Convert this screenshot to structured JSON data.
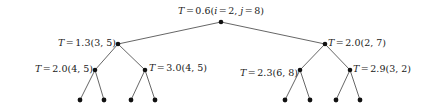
{
  "figure": {
    "type": "binary-tree-diagram",
    "width": 442,
    "height": 109,
    "background_color": "#ffffff",
    "node_color": "#111111",
    "edge_color": "#555555"
  },
  "tree": {
    "levels": 4,
    "nodes": [
      {
        "id": "root",
        "label_full": "T = 0.6(i = 2, j = 8)",
        "T_prefix": "T",
        "eq": "=",
        "T_value": "0.6",
        "open_paren": "(",
        "param1_name": "i",
        "param1_eq": "=",
        "param1_value": "2",
        "comma": ",",
        "param2_name": "j",
        "param2_eq": "=",
        "param2_value": "8",
        "close_paren": ")",
        "x": 221,
        "y": 22,
        "label_x": 221,
        "label_y": 11,
        "label_anchor": "center"
      },
      {
        "id": "n-left",
        "label_full": "T = 1.3(3, 5)",
        "T_prefix": "T",
        "eq": "=",
        "T_value": "1.3",
        "open_paren": "(",
        "param1_value": "3",
        "comma": ",",
        "param2_value": "5",
        "close_paren": ")",
        "x": 118,
        "y": 44,
        "label_x": 116,
        "label_y": 43,
        "label_anchor": "right"
      },
      {
        "id": "n-right",
        "label_full": "T = 2.0(2, 7)",
        "T_prefix": "T",
        "eq": "=",
        "T_value": "2.0",
        "open_paren": "(",
        "param1_value": "2",
        "comma": ",",
        "param2_value": "7",
        "close_paren": ")",
        "x": 325,
        "y": 44,
        "label_x": 328,
        "label_y": 43,
        "label_anchor": "left"
      },
      {
        "id": "n-left-left",
        "label_full": "T = 2.0(4, 5)",
        "T_prefix": "T",
        "eq": "=",
        "T_value": "2.0",
        "open_paren": "(",
        "param1_value": "4",
        "comma": ",",
        "param2_value": "5",
        "close_paren": ")",
        "x": 95,
        "y": 70,
        "label_x": 93,
        "label_y": 69,
        "label_anchor": "right"
      },
      {
        "id": "n-left-right",
        "label_full": "T = 3.0(4, 5)",
        "T_prefix": "T",
        "eq": "=",
        "T_value": "3.0",
        "open_paren": "(",
        "param1_value": "4",
        "comma": ",",
        "param2_value": "5",
        "close_paren": ")",
        "x": 145,
        "y": 70,
        "label_x": 149,
        "label_y": 68,
        "label_anchor": "left"
      },
      {
        "id": "n-right-left",
        "label_full": "T = 2.3(6, 8)",
        "T_prefix": "T",
        "eq": "=",
        "T_value": "2.3",
        "open_paren": "(",
        "param1_value": "6",
        "comma": ",",
        "param2_value": "8",
        "close_paren": ")",
        "x": 300,
        "y": 70,
        "label_x": 298,
        "label_y": 73,
        "label_anchor": "right"
      },
      {
        "id": "n-right-right",
        "label_full": "T = 2.9(3, 2)",
        "T_prefix": "T",
        "eq": "=",
        "T_value": "2.9",
        "open_paren": "(",
        "param1_value": "3",
        "comma": ",",
        "param2_value": "2",
        "close_paren": ")",
        "x": 350,
        "y": 70,
        "label_x": 353,
        "label_y": 69,
        "label_anchor": "left"
      }
    ],
    "leaves": [
      {
        "id": "leaf-1",
        "x": 80,
        "y": 100,
        "parent": "n-left-left"
      },
      {
        "id": "leaf-2",
        "x": 104,
        "y": 100,
        "parent": "n-left-left"
      },
      {
        "id": "leaf-3",
        "x": 131,
        "y": 100,
        "parent": "n-left-right"
      },
      {
        "id": "leaf-4",
        "x": 155,
        "y": 100,
        "parent": "n-left-right"
      },
      {
        "id": "leaf-5",
        "x": 285,
        "y": 100,
        "parent": "n-right-left"
      },
      {
        "id": "leaf-6",
        "x": 310,
        "y": 100,
        "parent": "n-right-left"
      },
      {
        "id": "leaf-7",
        "x": 336,
        "y": 100,
        "parent": "n-right-right"
      },
      {
        "id": "leaf-8",
        "x": 360,
        "y": 100,
        "parent": "n-right-right"
      }
    ],
    "edges": [
      {
        "from": "root",
        "to": "n-left"
      },
      {
        "from": "root",
        "to": "n-right"
      },
      {
        "from": "n-left",
        "to": "n-left-left"
      },
      {
        "from": "n-left",
        "to": "n-left-right"
      },
      {
        "from": "n-right",
        "to": "n-right-left"
      },
      {
        "from": "n-right",
        "to": "n-right-right"
      },
      {
        "from": "n-left-left",
        "to": "leaf-1"
      },
      {
        "from": "n-left-left",
        "to": "leaf-2"
      },
      {
        "from": "n-left-right",
        "to": "leaf-3"
      },
      {
        "from": "n-left-right",
        "to": "leaf-4"
      },
      {
        "from": "n-right-left",
        "to": "leaf-5"
      },
      {
        "from": "n-right-left",
        "to": "leaf-6"
      },
      {
        "from": "n-right-right",
        "to": "leaf-7"
      },
      {
        "from": "n-right-right",
        "to": "leaf-8"
      }
    ]
  }
}
